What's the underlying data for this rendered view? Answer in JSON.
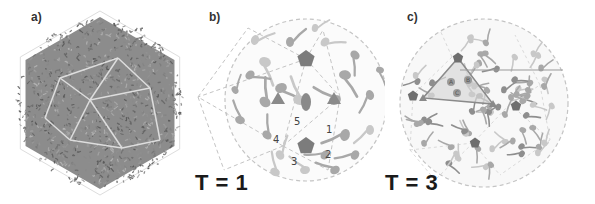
{
  "figure": {
    "panels": [
      {
        "id": "a",
        "label": "a)",
        "description": "atomic model of capsid"
      },
      {
        "id": "b",
        "label": "b)",
        "description": "T = 1 icosahedral capsid schematic"
      },
      {
        "id": "c",
        "label": "c)",
        "description": "T = 3 icosahedral capsid schematic"
      }
    ],
    "t_numbers": {
      "b": "T = 1",
      "c": "T = 3"
    },
    "subunit_numbers": [
      "1",
      "2",
      "3",
      "4",
      "5"
    ],
    "triangle_labels": [
      "A",
      "B",
      "C"
    ],
    "colors": {
      "background": "#ffffff",
      "protein_dark": "#7a7a7a",
      "subunit": "#a8a8a8",
      "subunit_light": "#c8c8c8",
      "axis_marker": "#8a8a8a",
      "dashed_line": "#c4c4c4",
      "text": "#1a1a1a"
    }
  }
}
